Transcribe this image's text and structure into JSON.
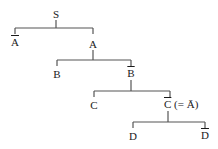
{
  "diagram": {
    "type": "tree",
    "line_color": "#555555",
    "nodes": [
      {
        "id": "S",
        "label": "S",
        "bar": false,
        "suffix": "",
        "x": 56,
        "y": 8
      },
      {
        "id": "Abar",
        "label": "A",
        "bar": true,
        "suffix": "",
        "x": 15,
        "y": 36
      },
      {
        "id": "A",
        "label": "A",
        "bar": false,
        "suffix": "",
        "x": 93,
        "y": 38
      },
      {
        "id": "B",
        "label": "B",
        "bar": false,
        "suffix": "",
        "x": 57,
        "y": 68
      },
      {
        "id": "Bbar",
        "label": "B",
        "bar": true,
        "suffix": "",
        "x": 131,
        "y": 67
      },
      {
        "id": "C",
        "label": "C",
        "bar": false,
        "suffix": "",
        "x": 94,
        "y": 99
      },
      {
        "id": "Cbar",
        "label": "C",
        "bar": true,
        "suffix": " (= Ā)",
        "x": 168,
        "y": 98
      },
      {
        "id": "D",
        "label": "D",
        "bar": false,
        "suffix": "",
        "x": 133,
        "y": 130
      },
      {
        "id": "Dbar",
        "label": "D",
        "bar": true,
        "suffix": "",
        "x": 205,
        "y": 129
      }
    ],
    "edges": [
      {
        "parent": "S",
        "children": [
          "Abar",
          "A"
        ],
        "bar_y": 28,
        "stem_top": 20,
        "x1": 15,
        "x2": 93,
        "px": 56,
        "drop_to": 34
      },
      {
        "parent": "A",
        "children": [
          "B",
          "Bbar"
        ],
        "bar_y": 60,
        "stem_top": 50,
        "x1": 57,
        "x2": 131,
        "px": 93,
        "drop_to": 66
      },
      {
        "parent": "Bbar",
        "children": [
          "C",
          "Cbar"
        ],
        "bar_y": 91,
        "stem_top": 80,
        "x1": 94,
        "x2": 170,
        "px": 131,
        "drop_to": 97
      },
      {
        "parent": "Cbar",
        "children": [
          "D",
          "Dbar"
        ],
        "bar_y": 122,
        "stem_top": 111,
        "x1": 133,
        "x2": 205,
        "px": 168,
        "drop_to": 128
      }
    ]
  }
}
